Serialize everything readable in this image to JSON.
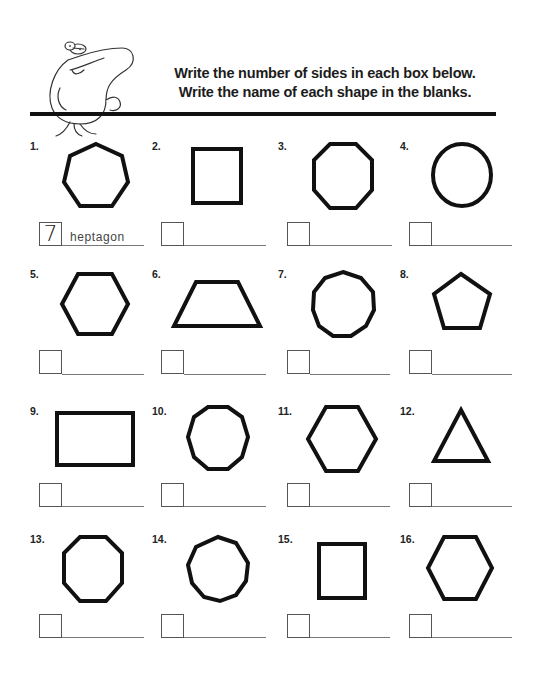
{
  "header": {
    "instruction_line_1": "Write the number of sides in each box below.",
    "instruction_line_2": "Write the name of each shape in the blanks.",
    "mascot": "frog-cartoon"
  },
  "problems": [
    {
      "number": "1.",
      "shape": "heptagon",
      "sides_answer": "7",
      "name_answer": "heptagon"
    },
    {
      "number": "2.",
      "shape": "square",
      "sides_answer": "",
      "name_answer": ""
    },
    {
      "number": "3.",
      "shape": "octagon",
      "sides_answer": "",
      "name_answer": ""
    },
    {
      "number": "4.",
      "shape": "circle",
      "sides_answer": "",
      "name_answer": ""
    },
    {
      "number": "5.",
      "shape": "hexagon",
      "sides_answer": "",
      "name_answer": ""
    },
    {
      "number": "6.",
      "shape": "trapezoid",
      "sides_answer": "",
      "name_answer": ""
    },
    {
      "number": "7.",
      "shape": "nonagon",
      "sides_answer": "",
      "name_answer": ""
    },
    {
      "number": "8.",
      "shape": "pentagon",
      "sides_answer": "",
      "name_answer": ""
    },
    {
      "number": "9.",
      "shape": "rectangle",
      "sides_answer": "",
      "name_answer": ""
    },
    {
      "number": "10.",
      "shape": "decagon",
      "sides_answer": "",
      "name_answer": ""
    },
    {
      "number": "11.",
      "shape": "hexagon",
      "sides_answer": "",
      "name_answer": ""
    },
    {
      "number": "12.",
      "shape": "triangle",
      "sides_answer": "",
      "name_answer": ""
    },
    {
      "number": "13.",
      "shape": "octagon",
      "sides_answer": "",
      "name_answer": ""
    },
    {
      "number": "14.",
      "shape": "nonagon",
      "sides_answer": "",
      "name_answer": ""
    },
    {
      "number": "15.",
      "shape": "rectangle",
      "sides_answer": "",
      "name_answer": ""
    },
    {
      "number": "16.",
      "shape": "hexagon",
      "sides_answer": "",
      "name_answer": ""
    }
  ]
}
